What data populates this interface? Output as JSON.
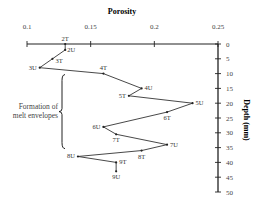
{
  "chart_data": {
    "type": "line",
    "title": "Porosity",
    "xlabel": "Porosity",
    "ylabel": "Depth (mm)",
    "x_axis_position": "top",
    "y_axis_position": "right",
    "xlim": [
      0.1,
      0.25
    ],
    "ylim": [
      0,
      50
    ],
    "y_inverted": true,
    "xticks": [
      0.1,
      0.15,
      0.2,
      0.25
    ],
    "xtick_labels": [
      "0.1",
      "0.15",
      "0.2",
      "0.25"
    ],
    "yticks": [
      0,
      5,
      10,
      15,
      20,
      25,
      30,
      35,
      40,
      45,
      50
    ],
    "ytick_labels": [
      "0",
      "5",
      "10",
      "15",
      "20",
      "25",
      "30",
      "35",
      "40",
      "45",
      "50"
    ],
    "grid": false,
    "series": [
      {
        "name": "Porosity profile",
        "points": [
          {
            "label": "2T",
            "porosity": 0.13,
            "depth": 0
          },
          {
            "label": "2U",
            "porosity": 0.13,
            "depth": 2
          },
          {
            "label": "3T",
            "porosity": 0.12,
            "depth": 5
          },
          {
            "label": "3U",
            "porosity": 0.11,
            "depth": 8
          },
          {
            "label": "4T",
            "porosity": 0.16,
            "depth": 10
          },
          {
            "label": "4U",
            "porosity": 0.19,
            "depth": 15
          },
          {
            "label": "5T",
            "porosity": 0.18,
            "depth": 17.5
          },
          {
            "label": "5U",
            "porosity": 0.23,
            "depth": 20
          },
          {
            "label": "6T",
            "porosity": 0.21,
            "depth": 23
          },
          {
            "label": "6U",
            "porosity": 0.16,
            "depth": 28
          },
          {
            "label": "7T",
            "porosity": 0.17,
            "depth": 30.5
          },
          {
            "label": "7U",
            "porosity": 0.21,
            "depth": 34
          },
          {
            "label": "8T",
            "porosity": 0.19,
            "depth": 36
          },
          {
            "label": "8U",
            "porosity": 0.14,
            "depth": 38
          },
          {
            "label": "9T",
            "porosity": 0.17,
            "depth": 40
          },
          {
            "label": "9U",
            "porosity": 0.17,
            "depth": 43
          }
        ]
      }
    ],
    "annotations": [
      {
        "text_lines": [
          "Formation of",
          "melt envelopes"
        ],
        "bracket_depth_range": [
          10,
          35
        ]
      }
    ]
  }
}
